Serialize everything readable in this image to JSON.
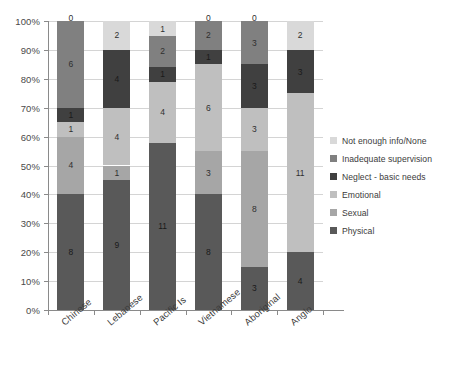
{
  "chart_data": {
    "type": "bar",
    "subtype": "stacked-100-percent",
    "title": "",
    "xlabel": "",
    "ylabel": "",
    "ylim": [
      0,
      100
    ],
    "ytick_labels": [
      "100%",
      "90%",
      "80%",
      "70%",
      "60%",
      "50%",
      "40%",
      "30%",
      "20%",
      "10%",
      "0%"
    ],
    "ytick_values": [
      100,
      90,
      80,
      70,
      60,
      50,
      40,
      30,
      20,
      10,
      0
    ],
    "grid": true,
    "legend_position": "right",
    "categories": [
      "Chinese",
      "Lebanese",
      "Pacific Is",
      "Vietnamese",
      "Aboriginal",
      "Anglo"
    ],
    "series": [
      {
        "name": "Physical",
        "color": "#595959",
        "values": [
          8,
          9,
          11,
          8,
          3,
          4
        ]
      },
      {
        "name": "Sexual",
        "color": "#a6a6a6",
        "values": [
          4,
          1,
          0,
          3,
          8,
          0
        ]
      },
      {
        "name": "Emotional",
        "color": "#bfbfbf",
        "values": [
          1,
          4,
          4,
          6,
          3,
          11
        ]
      },
      {
        "name": "Neglect - basic needs",
        "color": "#404040",
        "values": [
          1,
          4,
          1,
          1,
          3,
          3
        ]
      },
      {
        "name": "Inadequate supervision",
        "color": "#808080",
        "values": [
          6,
          0,
          2,
          2,
          3,
          0
        ]
      },
      {
        "name": "Not enough info/None",
        "color": "#d9d9d9",
        "values": [
          0,
          2,
          1,
          0,
          0,
          2
        ]
      }
    ],
    "legend_order_top_to_bottom": [
      "Not enough info/None",
      "Inadequate supervision",
      "Neglect - basic needs",
      "Emotional",
      "Sexual",
      "Physical"
    ],
    "stack_order_bottom_to_top": [
      "Physical",
      "Sexual",
      "Emotional",
      "Neglect - basic needs",
      "Inadequate supervision",
      "Not enough info/None"
    ],
    "column_totals": [
      20,
      20,
      19,
      20,
      20,
      20
    ]
  }
}
